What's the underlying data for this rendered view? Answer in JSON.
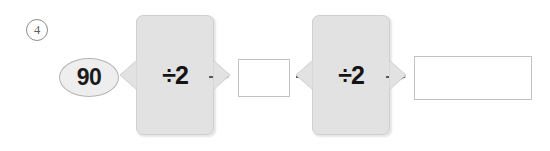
{
  "worksheet": {
    "item_number": "4",
    "item_number_style": "circled",
    "type": "function-machine-chain"
  },
  "colors": {
    "machine_fill": "#e2e2e2",
    "machine_border": "#cfcfcf",
    "oval_fill": "#eeeeee",
    "oval_border": "#b4b4b4",
    "box_border": "#c2c2c2",
    "text": "#141414",
    "marker": "#5f5f5f",
    "page_background": "#ffffff"
  },
  "flow": {
    "input": {
      "shape": "oval",
      "value": "90"
    },
    "arrow_1": {
      "icon": "arrow-right-icon"
    },
    "machine_1": {
      "operation": "÷2",
      "operator_symbol": "÷",
      "operand": "2",
      "inlet": "funnel-wedge",
      "outlet": "funnel-wedge"
    },
    "arrow_2": {
      "icon": "arrow-right-icon"
    },
    "answer_1": {
      "shape": "rectangle",
      "value": "",
      "placeholder": ""
    },
    "arrow_3": {
      "icon": "arrow-right-icon"
    },
    "machine_2": {
      "operation": "÷2",
      "operator_symbol": "÷",
      "operand": "2",
      "inlet": "funnel-wedge",
      "outlet": "funnel-wedge"
    },
    "arrow_4": {
      "icon": "arrow-right-icon"
    },
    "answer_2": {
      "shape": "rectangle",
      "value": "",
      "placeholder": ""
    }
  }
}
